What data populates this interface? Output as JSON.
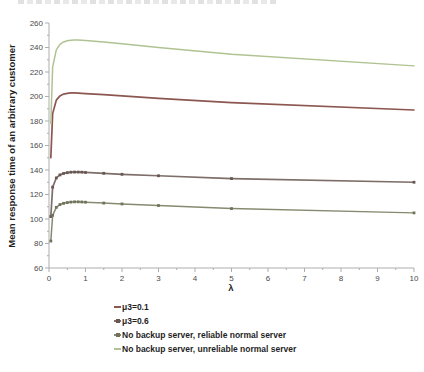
{
  "colors": {
    "axis": "#adadad",
    "tick_label": "#4a4a4a",
    "label_text": "#1f1f1f"
  },
  "chart_data": {
    "type": "line",
    "title": "",
    "xlabel": "λ",
    "ylabel": "Mean response time of an arbitrary customer",
    "xlim": [
      0,
      10
    ],
    "ylim": [
      60,
      260
    ],
    "x_ticks": [
      0,
      1,
      2,
      3,
      4,
      5,
      6,
      7,
      8,
      9,
      10
    ],
    "y_ticks": [
      60,
      80,
      100,
      120,
      140,
      160,
      180,
      200,
      220,
      240,
      260
    ],
    "grid": false,
    "legend_position": "below-left",
    "x": [
      0.05,
      0.1,
      0.2,
      0.3,
      0.4,
      0.5,
      0.6,
      0.7,
      0.8,
      0.9,
      1,
      1.5,
      2,
      3,
      5,
      10
    ],
    "series": [
      {
        "name": "μ3=0.1",
        "color": "#8c5750",
        "marker": "none",
        "line_width": 1.7,
        "values": [
          150,
          186,
          197,
          200.5,
          202,
          202.5,
          203,
          203,
          202.8,
          202.6,
          202.4,
          201.5,
          200.5,
          198.5,
          195,
          189
        ]
      },
      {
        "name": "μ3=0.6",
        "color": "#7d6e69",
        "marker": "square",
        "marker_color": "#675750",
        "line_width": 1.7,
        "values": [
          102,
          126,
          133.5,
          136,
          137.2,
          137.8,
          138.2,
          138.3,
          138.3,
          138.2,
          138,
          137.3,
          136.5,
          135.3,
          133,
          130
        ]
      },
      {
        "name": "No backup server, reliable normal server",
        "color": "#878a70",
        "marker": "square",
        "marker_color": "#70735a",
        "line_width": 1.5,
        "values": [
          82,
          103,
          109.5,
          111.8,
          112.8,
          113.4,
          113.8,
          114,
          114,
          113.9,
          113.7,
          113,
          112.3,
          111,
          108.5,
          105
        ]
      },
      {
        "name": "No backup server, unreliable normal server",
        "color": "#afc392",
        "marker": "none",
        "line_width": 1.5,
        "values": [
          178,
          224,
          238,
          242.5,
          244.5,
          245.5,
          246,
          246.2,
          246.2,
          246,
          245.8,
          244.5,
          243,
          240,
          234.5,
          225
        ]
      }
    ]
  }
}
